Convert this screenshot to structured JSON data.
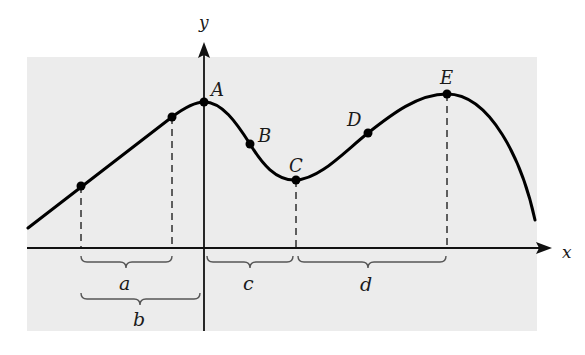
{
  "figure": {
    "background_panel_color": "#ececec",
    "curve_color": "#000000",
    "axes": {
      "x_label": "x",
      "y_label": "y"
    },
    "points": [
      {
        "label": "A",
        "x": 204,
        "y": 102
      },
      {
        "label": "B",
        "x": 250,
        "y": 144
      },
      {
        "label": "C",
        "x": 296,
        "y": 180
      },
      {
        "label": "D",
        "x": 368,
        "y": 133
      },
      {
        "label": "E",
        "x": 447,
        "y": 94
      }
    ],
    "unlabeled_points": [
      {
        "x": 81,
        "y": 186
      },
      {
        "x": 172,
        "y": 117
      }
    ],
    "intervals": [
      {
        "label": "a",
        "from": "left dot",
        "to": "second dot"
      },
      {
        "label": "b",
        "from": "left dot",
        "to": "y-axis"
      },
      {
        "label": "c",
        "from": "y-axis",
        "to": "C"
      },
      {
        "label": "d",
        "from": "C",
        "to": "E"
      }
    ],
    "labels": {
      "A": "A",
      "B": "B",
      "C": "C",
      "D": "D",
      "E": "E",
      "a": "a",
      "b": "b",
      "c": "c",
      "d": "d"
    }
  }
}
